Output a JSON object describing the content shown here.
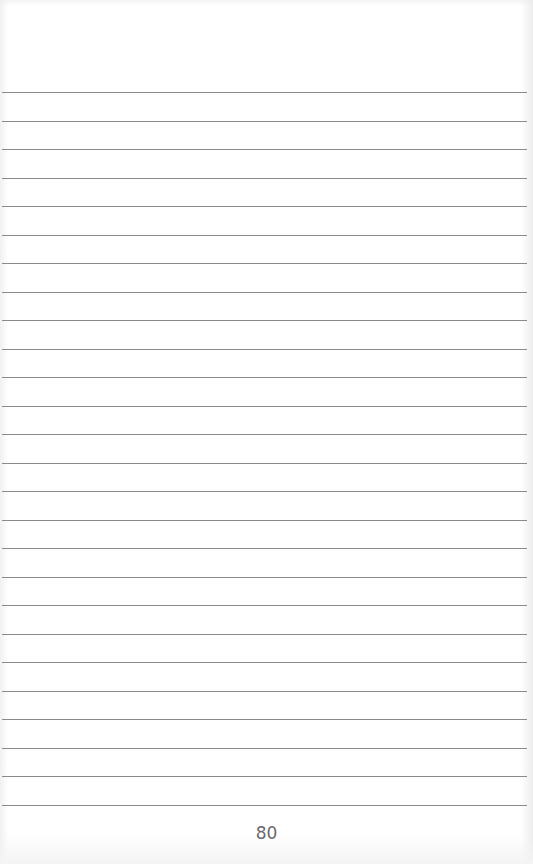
{
  "page": {
    "type": "lined-notebook-page",
    "page_number": "80",
    "ruled_lines": {
      "count": 26,
      "first_y": 92,
      "last_y": 805,
      "spacing": 28.52,
      "color": "#8a8a8a"
    },
    "colors": {
      "paper": "#ffffff",
      "page_number_text": "#6a6a6a"
    }
  }
}
